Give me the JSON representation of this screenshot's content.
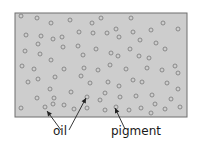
{
  "diagram": {
    "panel": {
      "x": 15,
      "y": 13,
      "width": 172,
      "height": 104,
      "fill": "#cdcdcd",
      "stroke": "#6e6e6e"
    },
    "particle_style": {
      "radius": 2,
      "stroke": "#7a7a7a",
      "fill": "none"
    },
    "particles": [
      [
        21,
        16
      ],
      [
        37,
        18
      ],
      [
        51,
        23
      ],
      [
        70,
        20
      ],
      [
        92,
        23
      ],
      [
        101,
        18
      ],
      [
        131,
        18
      ],
      [
        163,
        23
      ],
      [
        178,
        29
      ],
      [
        26,
        35
      ],
      [
        41,
        36
      ],
      [
        53,
        39
      ],
      [
        62,
        37
      ],
      [
        79,
        32
      ],
      [
        93,
        33
      ],
      [
        107,
        33
      ],
      [
        116,
        29
      ],
      [
        119,
        37
      ],
      [
        133,
        32
      ],
      [
        151,
        30
      ],
      [
        140,
        40
      ],
      [
        156,
        43
      ],
      [
        38,
        44
      ],
      [
        63,
        47
      ],
      [
        78,
        46
      ],
      [
        96,
        49
      ],
      [
        25,
        51
      ],
      [
        40,
        54
      ],
      [
        83,
        55
      ],
      [
        111,
        53
      ],
      [
        118,
        56
      ],
      [
        130,
        49
      ],
      [
        139,
        56
      ],
      [
        149,
        58
      ],
      [
        165,
        49
      ],
      [
        51,
        60
      ],
      [
        22,
        66
      ],
      [
        34,
        69
      ],
      [
        64,
        69
      ],
      [
        84,
        68
      ],
      [
        98,
        70
      ],
      [
        110,
        65
      ],
      [
        126,
        69
      ],
      [
        147,
        68
      ],
      [
        162,
        70
      ],
      [
        175,
        66
      ],
      [
        178,
        73
      ],
      [
        28,
        82
      ],
      [
        38,
        79
      ],
      [
        55,
        77
      ],
      [
        81,
        76
      ],
      [
        90,
        83
      ],
      [
        108,
        82
      ],
      [
        119,
        86
      ],
      [
        133,
        80
      ],
      [
        142,
        82
      ],
      [
        167,
        83
      ],
      [
        50,
        89
      ],
      [
        71,
        92
      ],
      [
        105,
        93
      ],
      [
        178,
        89
      ],
      [
        37,
        98
      ],
      [
        54,
        98
      ],
      [
        87,
        97
      ],
      [
        100,
        100
      ],
      [
        120,
        97
      ],
      [
        136,
        96
      ],
      [
        152,
        95
      ],
      [
        171,
        99
      ],
      [
        21,
        108
      ],
      [
        45,
        107
      ],
      [
        53,
        104
      ],
      [
        64,
        105
      ],
      [
        74,
        109
      ],
      [
        87,
        108
      ],
      [
        105,
        110
      ],
      [
        116,
        107
      ],
      [
        129,
        110
      ],
      [
        141,
        108
      ],
      [
        151,
        113
      ],
      [
        155,
        104
      ],
      [
        165,
        109
      ],
      [
        180,
        107
      ]
    ],
    "labels": [
      {
        "text": "oil",
        "x": 53,
        "y": 128
      },
      {
        "text": "pigment",
        "x": 111,
        "y": 128
      }
    ],
    "arrows": [
      {
        "from": [
          61,
          130
        ],
        "to": [
          47,
          111
        ],
        "target": "oil"
      },
      {
        "from": [
          69,
          130
        ],
        "to": [
          86,
          98
        ],
        "target": "oil"
      },
      {
        "from": [
          125,
          129
        ],
        "to": [
          115,
          108
        ],
        "target": "pigment"
      }
    ]
  }
}
